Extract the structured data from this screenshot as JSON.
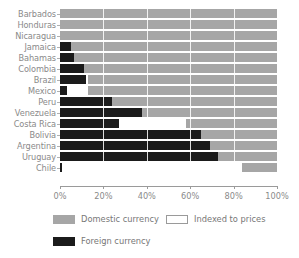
{
  "chart_data": {
    "type": "bar",
    "subtype": "stacked-horizontal-100-percent",
    "title": "",
    "subtitle": "",
    "xlabel": "",
    "ylabel": "",
    "xlim": [
      0,
      100
    ],
    "xticks": [
      0,
      20,
      40,
      60,
      80,
      100
    ],
    "xtick_labels": [
      "0%",
      "20%",
      "40%",
      "60%",
      "80%",
      "100%"
    ],
    "grid": false,
    "legend_position": "bottom-left",
    "categories": [
      "Barbados",
      "Honduras",
      "Nicaragua",
      "Jamaica",
      "Bahamas",
      "Colombia",
      "Brazil",
      "Mexico",
      "Peru",
      "Venezuela",
      "Costa Rica",
      "Bolivia",
      "Argentina",
      "Uruguay",
      "Chile"
    ],
    "series": [
      {
        "name": "Foreign currency",
        "color": "#1b1b1b",
        "values": [
          0,
          0,
          0,
          5,
          6.5,
          11,
          12,
          3,
          24,
          38,
          27,
          65,
          69,
          73,
          1
        ]
      },
      {
        "name": "Indexed to prices",
        "color": "#ffffff",
        "values": [
          0,
          0,
          0,
          0,
          0,
          0,
          1,
          10,
          0,
          0,
          31,
          0,
          0,
          0,
          83
        ]
      },
      {
        "name": "Domestic currency",
        "color": "#a6a6a6",
        "values": [
          100,
          100,
          100,
          95,
          93.5,
          89,
          87,
          87,
          76,
          62,
          42,
          35,
          31,
          27,
          16
        ]
      }
    ]
  },
  "legend": {
    "items": [
      {
        "label": "Domestic currency",
        "swatch": "domestic"
      },
      {
        "label": "Indexed to prices",
        "swatch": "indexed"
      },
      {
        "label": "Foreign currency",
        "swatch": "foreign"
      }
    ]
  },
  "colors": {
    "foreign": "#1b1b1b",
    "indexed": "#ffffff",
    "domestic": "#a6a6a6",
    "axis": "#9a9a9a",
    "text": "#8a8a8a"
  }
}
